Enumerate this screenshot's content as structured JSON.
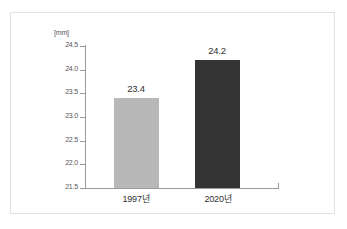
{
  "chart_data": {
    "type": "bar",
    "title": "",
    "subtitle": "",
    "xlabel": "",
    "ylabel": "",
    "unit_label": "[mm]",
    "categories": [
      "1997년",
      "2020년"
    ],
    "values": [
      23.4,
      24.2
    ],
    "data_labels": [
      "23.4",
      "24.2"
    ],
    "ylim": [
      21.5,
      24.5
    ],
    "ytick_values": [
      24.5,
      24.0,
      23.5,
      23.0,
      22.5,
      22.0,
      21.5
    ],
    "ytick_labels": [
      "24.5",
      "24.0",
      "23.5",
      "23.0",
      "22.5",
      "22.0",
      "21.5"
    ],
    "grid": false,
    "legend": false,
    "legend_position": "none",
    "bar_colors": [
      "#b8b8b8",
      "#343434"
    ],
    "axis_color": "#9a9a9a",
    "text_color": "#303030",
    "tick_text_color": "#555555",
    "frame_color": "#e2e2e2",
    "background": "#ffffff"
  }
}
